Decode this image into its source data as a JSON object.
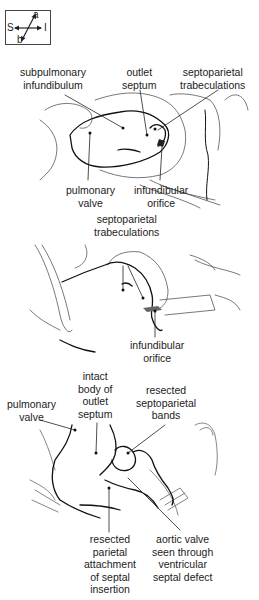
{
  "orientation": {
    "labels": {
      "top": "a",
      "bottom": "b",
      "left": "S",
      "right": "I"
    }
  },
  "panels": [
    {
      "id": "panel-1",
      "labels": [
        {
          "key": "subpulmonary_infundibulum",
          "text": "subpulmonary\ninfundibulum"
        },
        {
          "key": "outlet_septum",
          "text": "outlet\nseptum"
        },
        {
          "key": "septoparietal_trabeculations",
          "text": "septoparietal\ntrabeculations"
        },
        {
          "key": "pulmonary_valve",
          "text": "pulmonary\nvalve"
        },
        {
          "key": "infundibular_orifice",
          "text": "infundibular\norifice"
        }
      ]
    },
    {
      "id": "panel-2",
      "labels": [
        {
          "key": "septoparietal_trabeculations",
          "text": "septoparietal\ntrabeculations"
        },
        {
          "key": "infundibular_orifice",
          "text": "infundibular\norifice"
        }
      ]
    },
    {
      "id": "panel-3",
      "labels": [
        {
          "key": "pulmonary_valve",
          "text": "pulmonary\nvalve"
        },
        {
          "key": "intact_body_outlet_septum",
          "text": "intact\nbody of\noutlet\nseptum"
        },
        {
          "key": "resected_septoparietal_bands",
          "text": "resected\nseptoparietal\nbands"
        },
        {
          "key": "resected_parietal_attachment",
          "text": "resected\nparietal\nattachment\nof septal\ninsertion"
        },
        {
          "key": "aortic_valve_through_vsd",
          "text": "aortic valve\nseen through\nventricular\nseptal defect"
        }
      ]
    }
  ],
  "colors": {
    "line": "#222222",
    "light_line": "#888888",
    "background": "#ffffff"
  }
}
